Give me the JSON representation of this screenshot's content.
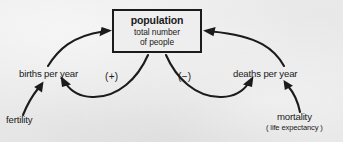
{
  "diagram": {
    "type": "causal-loop-diagram",
    "background_color": "#e9e9e9",
    "ink_color": "#1b1b1b",
    "stock": {
      "name": "population",
      "subtitle_line_1": "total number",
      "subtitle_line_2": "of people"
    },
    "nodes": [
      {
        "id": "births",
        "label": "births per year"
      },
      {
        "id": "deaths",
        "label": "deaths per year"
      },
      {
        "id": "fertility",
        "label": "fertility"
      },
      {
        "id": "mortality",
        "label": "mortality",
        "sublabel": "( life expectancy )"
      }
    ],
    "signs": [
      {
        "id": "positive-loop",
        "label": "(+)"
      },
      {
        "id": "negative-loop",
        "label": "(−)"
      }
    ],
    "links": [
      {
        "from": "births",
        "to": "population",
        "polarity": "positive"
      },
      {
        "from": "deaths",
        "to": "population",
        "polarity": "negative"
      },
      {
        "from": "population",
        "to": "births",
        "polarity": "positive"
      },
      {
        "from": "population",
        "to": "deaths",
        "polarity": "negative"
      },
      {
        "from": "fertility",
        "to": "births",
        "polarity": "positive"
      },
      {
        "from": "mortality",
        "to": "deaths",
        "polarity": "positive"
      }
    ]
  }
}
